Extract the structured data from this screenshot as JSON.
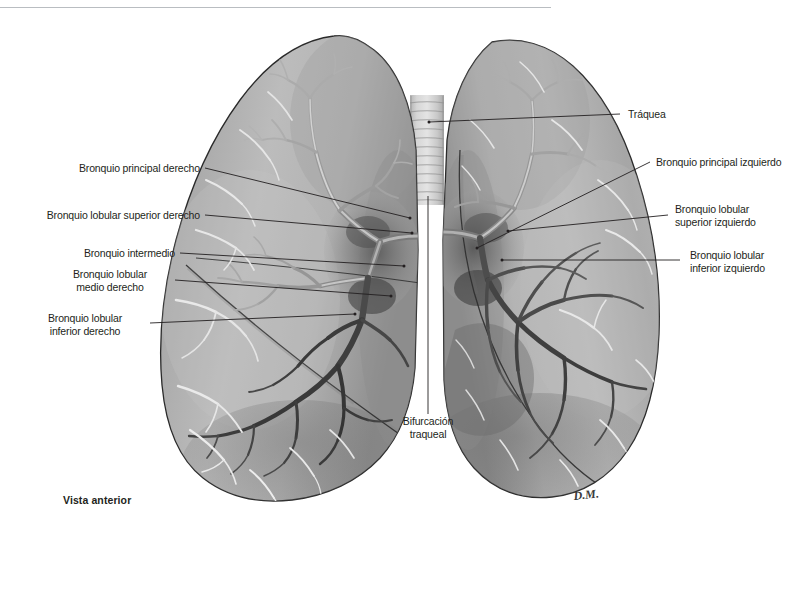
{
  "figure": {
    "title_caption": "Vista anterior",
    "artist_signature": "D.M.",
    "view_label": "Vista anterior",
    "background_color": "#ffffff",
    "ink_color": "#231f20",
    "rule_color": "#b9bdc1"
  },
  "labels": {
    "trachea": "Tráquea",
    "right_main_bronchus": "Bronquio principal derecho",
    "right_superior_lobar_bronchus": "Bronquio lobular superior derecho",
    "intermediate_bronchus": "Bronquio intermedio",
    "right_middle_lobar_bronchus_l1": "Bronquio lobular",
    "right_middle_lobar_bronchus_l2": "medio derecho",
    "right_inferior_lobar_bronchus_l1": "Bronquio lobular",
    "right_inferior_lobar_bronchus_l2": "inferior derecho",
    "left_main_bronchus": "Bronquio principal izquierdo",
    "left_superior_lobar_bronchus_l1": "Bronquio lobular",
    "left_superior_lobar_bronchus_l2": "superior izquierdo",
    "left_inferior_lobar_bronchus_l1": "Bronquio lobular",
    "left_inferior_lobar_bronchus_l2": "inferior izquierdo",
    "tracheal_bifurcation_l1": "Bifurcación",
    "tracheal_bifurcation_l2": "traqueal"
  }
}
